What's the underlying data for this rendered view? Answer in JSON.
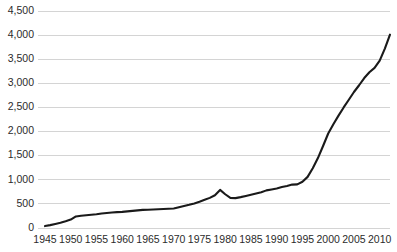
{
  "chart_data": {
    "type": "line",
    "title": "",
    "subtitle": "",
    "xlabel": "",
    "ylabel": "",
    "grid": "horizontal",
    "legend": "none",
    "xlim": [
      1945,
      2012
    ],
    "ylim": [
      0,
      4500
    ],
    "x_tick_labels": [
      "1945",
      "1950",
      "1955",
      "1960",
      "1965",
      "1970",
      "1975",
      "1980",
      "1985",
      "1990",
      "1995",
      "2000",
      "2005",
      "2010"
    ],
    "x_tick_values": [
      1945,
      1950,
      1955,
      1960,
      1965,
      1970,
      1975,
      1980,
      1985,
      1990,
      1995,
      2000,
      2005,
      2010
    ],
    "y_tick_labels": [
      "0",
      "500",
      "1,000",
      "1,500",
      "2,000",
      "2,500",
      "3,000",
      "3,500",
      "4,000",
      "4,500"
    ],
    "y_tick_values": [
      0,
      500,
      1000,
      1500,
      2000,
      2500,
      3000,
      3500,
      4000,
      4500
    ],
    "line_color": "#1a1a1a",
    "grid_color": "#d4d4d4",
    "series": [
      {
        "name": "series-1",
        "x": [
          1945,
          1946,
          1947,
          1948,
          1949,
          1950,
          1951,
          1952,
          1953,
          1954,
          1955,
          1956,
          1957,
          1958,
          1959,
          1960,
          1961,
          1962,
          1963,
          1964,
          1965,
          1966,
          1967,
          1968,
          1969,
          1970,
          1971,
          1972,
          1973,
          1974,
          1975,
          1976,
          1977,
          1978,
          1979,
          1980,
          1981,
          1982,
          1983,
          1984,
          1985,
          1986,
          1987,
          1988,
          1989,
          1990,
          1991,
          1992,
          1993,
          1994,
          1995,
          1996,
          1997,
          1998,
          1999,
          2000,
          2001,
          2002,
          2003,
          2004,
          2005,
          2006,
          2007,
          2008,
          2009,
          2010,
          2011,
          2012
        ],
        "values": [
          40,
          60,
          85,
          110,
          140,
          175,
          240,
          255,
          265,
          275,
          285,
          300,
          310,
          320,
          330,
          335,
          345,
          355,
          365,
          375,
          380,
          385,
          390,
          395,
          400,
          405,
          430,
          455,
          480,
          510,
          545,
          585,
          625,
          680,
          790,
          700,
          625,
          620,
          640,
          665,
          690,
          715,
          740,
          780,
          800,
          820,
          850,
          870,
          900,
          905,
          960,
          1060,
          1240,
          1450,
          1700,
          1960,
          2150,
          2330,
          2500,
          2660,
          2820,
          2960,
          3110,
          3230,
          3320,
          3470,
          3720,
          4010
        ]
      }
    ]
  }
}
